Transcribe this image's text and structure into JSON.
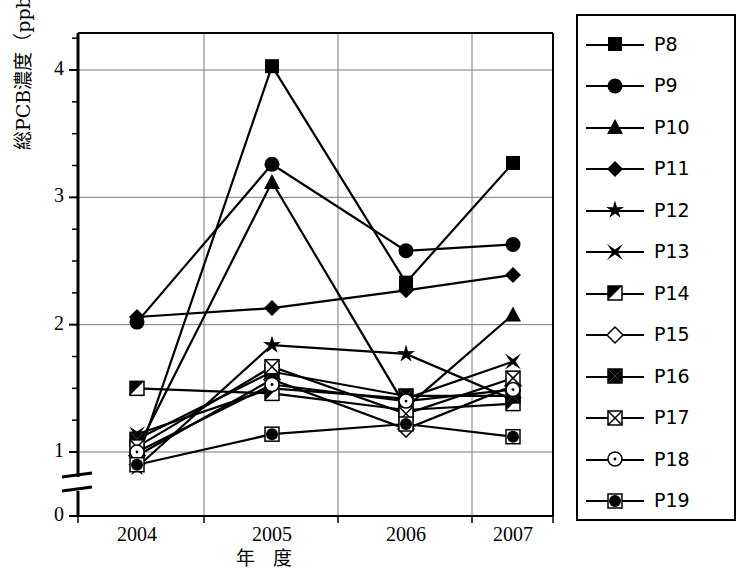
{
  "chart_data": {
    "type": "line",
    "title": "",
    "xlabel": "年 度",
    "ylabel": "総PCB濃度（ppb）",
    "categories": [
      "2004",
      "2005",
      "2006",
      "2007"
    ],
    "x_tick_labels": [
      "2004",
      "2005",
      "2006",
      "2007"
    ],
    "y_tick_labels": [
      "0",
      "1",
      "2",
      "3",
      "4"
    ],
    "y_tick_values": [
      0,
      1,
      2,
      3,
      4
    ],
    "ylim": [
      0,
      4.35
    ],
    "y_axis_break": true,
    "y_axis_break_note": "axis broken between 0 and 1",
    "grid": "horizontal-and-vertical",
    "legend_position": "right-outside",
    "series": [
      {
        "name": "P8",
        "marker": "filled-square",
        "values": [
          0.93,
          4.03,
          2.33,
          3.27
        ]
      },
      {
        "name": "P9",
        "marker": "filled-circle",
        "values": [
          2.02,
          3.26,
          2.58,
          2.63
        ]
      },
      {
        "name": "P10",
        "marker": "filled-triangle",
        "values": [
          1.02,
          3.12,
          1.35,
          2.08
        ]
      },
      {
        "name": "P11",
        "marker": "filled-diamond",
        "values": [
          2.06,
          2.13,
          2.27,
          2.39
        ]
      },
      {
        "name": "P12",
        "marker": "filled-star",
        "values": [
          0.88,
          1.84,
          1.77,
          1.41
        ]
      },
      {
        "name": "P13",
        "marker": "filled-cross-x",
        "values": [
          1.14,
          1.5,
          1.42,
          1.71
        ]
      },
      {
        "name": "P14",
        "marker": "half-filled-square",
        "values": [
          1.5,
          1.46,
          1.33,
          1.38
        ]
      },
      {
        "name": "P15",
        "marker": "open-diamond",
        "values": [
          0.97,
          1.57,
          1.18,
          1.52
        ]
      },
      {
        "name": "P16",
        "marker": "square-filled-bowtie",
        "values": [
          1.1,
          1.63,
          1.44,
          1.44
        ]
      },
      {
        "name": "P17",
        "marker": "open-square-x",
        "values": [
          1.04,
          1.67,
          1.3,
          1.58
        ]
      },
      {
        "name": "P18",
        "marker": "circle-dot",
        "values": [
          1.0,
          1.53,
          1.4,
          1.49
        ]
      },
      {
        "name": "P19",
        "marker": "circle-in-square",
        "values": [
          0.9,
          1.14,
          1.22,
          1.12
        ]
      }
    ]
  },
  "legend": {
    "items": [
      {
        "label": "P8"
      },
      {
        "label": "P9"
      },
      {
        "label": "P10"
      },
      {
        "label": "P11"
      },
      {
        "label": "P12"
      },
      {
        "label": "P13"
      },
      {
        "label": "P14"
      },
      {
        "label": "P15"
      },
      {
        "label": "P16"
      },
      {
        "label": "P17"
      },
      {
        "label": "P18"
      },
      {
        "label": "P19"
      }
    ]
  },
  "colors": {
    "ink": "#000000",
    "grid": "#808080",
    "background": "#ffffff"
  }
}
